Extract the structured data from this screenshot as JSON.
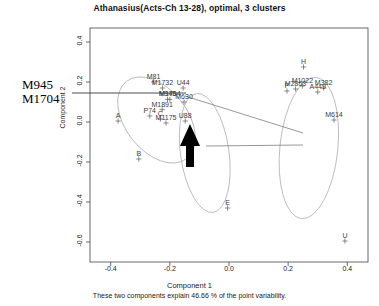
{
  "chart_data": {
    "type": "scatter",
    "title": "Athanasius(Acts-Ch 13-28), optimal, 3 clusters",
    "xlabel": "Component 1",
    "ylabel": "Component 2",
    "subtitle": "These two components explain 46.66 % of the point variability.",
    "xlim": [
      -0.47,
      0.47
    ],
    "ylim": [
      -0.7,
      0.47
    ],
    "xticks": [
      "-0.4",
      "-0.2",
      "0.0",
      "0.2",
      "0.4"
    ],
    "xtick_values": [
      -0.4,
      -0.2,
      0.0,
      0.2,
      0.4
    ],
    "yticks": [
      "0.4",
      "0.2",
      "0.0",
      "-0.2",
      "-0.4",
      "-0.6"
    ],
    "ytick_values": [
      0.4,
      0.2,
      0.0,
      -0.2,
      -0.4,
      -0.6
    ],
    "grid": false,
    "legend": "none",
    "point_color": "#6e6e6e",
    "ellipse_color": "#b9b9b9",
    "axis_color": "#444444",
    "points": [
      {
        "label": "A",
        "x": -0.375,
        "y": 0.005,
        "cluster": 1
      },
      {
        "label": "B",
        "x": -0.305,
        "y": -0.185,
        "cluster": 1
      },
      {
        "label": "M81",
        "x": -0.255,
        "y": 0.2,
        "cluster": 1
      },
      {
        "label": "M1732",
        "x": -0.225,
        "y": 0.17,
        "cluster": 1
      },
      {
        "label": "U44",
        "x": -0.155,
        "y": 0.17,
        "cluster": 1
      },
      {
        "label": "M945",
        "x": -0.208,
        "y": 0.113,
        "cluster": 1
      },
      {
        "label": "M1704",
        "x": -0.2,
        "y": 0.113,
        "cluster": 1
      },
      {
        "label": "M630",
        "x": -0.152,
        "y": 0.1,
        "cluster": 1
      },
      {
        "label": "M1891",
        "x": -0.226,
        "y": 0.062,
        "cluster": 1
      },
      {
        "label": "P74",
        "x": -0.268,
        "y": 0.03,
        "cluster": 1
      },
      {
        "label": "C",
        "x": -0.232,
        "y": 0.015,
        "cluster": 1
      },
      {
        "label": "M1175",
        "x": -0.213,
        "y": -0.005,
        "cluster": 1
      },
      {
        "label": "U88",
        "x": -0.148,
        "y": 0.005,
        "cluster": 1
      },
      {
        "label": "E",
        "x": -0.005,
        "y": -0.43,
        "cluster": 2
      },
      {
        "label": "H",
        "x": 0.252,
        "y": 0.275,
        "cluster": 3
      },
      {
        "label": "M1022",
        "x": 0.248,
        "y": 0.18,
        "cluster": 3
      },
      {
        "label": "M382",
        "x": 0.32,
        "y": 0.17,
        "cluster": 3
      },
      {
        "label": "A449",
        "x": 0.3,
        "y": 0.15,
        "cluster": 3
      },
      {
        "label": "M2863",
        "x": 0.225,
        "y": 0.165,
        "cluster": 3
      },
      {
        "label": "P",
        "x": 0.196,
        "y": 0.155,
        "cluster": 3
      },
      {
        "label": "M614",
        "x": 0.355,
        "y": 0.01,
        "cluster": 3
      },
      {
        "label": "U",
        "x": 0.392,
        "y": -0.595,
        "cluster": 3
      }
    ],
    "ellipses": [
      {
        "cluster": 1,
        "cx": -0.245,
        "cy": 0.01,
        "rx": 0.105,
        "ry": 0.245,
        "rotation": -38
      },
      {
        "cluster": 2,
        "cx": -0.082,
        "cy": -0.155,
        "rx": 0.082,
        "ry": 0.3,
        "rotation": -8
      },
      {
        "cluster": 3,
        "cx": 0.27,
        "cy": -0.13,
        "rx": 0.098,
        "ry": 0.355,
        "rotation": 6
      }
    ],
    "annotation": {
      "line1": "M945",
      "line2": "M1704",
      "target_label": "M945/M1704 overlapping labels"
    },
    "arrow": {
      "name": "highlight-arrow",
      "direction": "up",
      "color": "#000000",
      "points_at": "M1175/U88 region"
    },
    "leader_lines": 2
  }
}
